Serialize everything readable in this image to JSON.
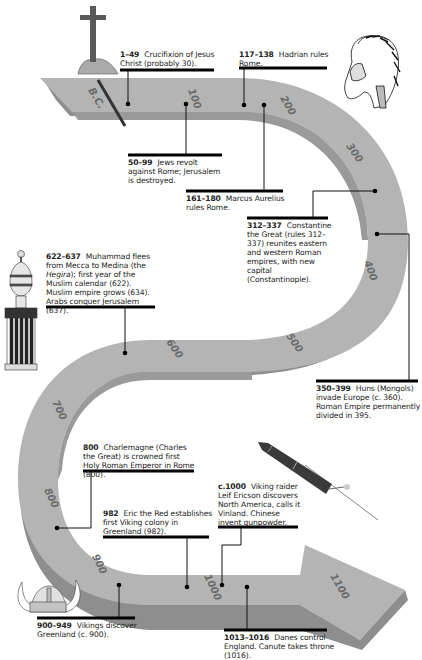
{
  "diagram": {
    "type": "timeline",
    "shape": "s-curve-arrow",
    "colors": {
      "ribbon_top": "#b4b4b4",
      "ribbon_side": "#8e8e8e",
      "line": "#111111",
      "text": "#222222"
    },
    "era_marker": "B.C.",
    "ticks": [
      "100",
      "200",
      "300",
      "400",
      "500",
      "600",
      "700",
      "800",
      "900",
      "1000",
      "1100"
    ],
    "events": [
      {
        "years": "1–49",
        "text": "Crucifixion of Jesus Christ (probably 30)."
      },
      {
        "years": "50–99",
        "text": "Jews revolt against Rome; Jerusalem is destroyed."
      },
      {
        "years": "117–138",
        "text": "Hadrian rules Rome."
      },
      {
        "years": "161–180",
        "text": "Marcus Aurelius rules Rome."
      },
      {
        "years": "312–337",
        "text": "Constantine the Great (rules 312–337) reunites eastern and western Roman empires, with new capital (Constantinople)."
      },
      {
        "years": "350–399",
        "text": "Huns (Mongols) invade Europe (c. 360). Roman Empire permanently divided in 395."
      },
      {
        "years": "622–637",
        "text_before": "Muhammad flees from Mecca to Medina (the ",
        "italic": "Hegira",
        "text_after": "); first year of the Muslim calendar (622). Muslim empire grows (634). Arabs conquer Jerusalem (637)."
      },
      {
        "years": "800",
        "text": "Charlemagne (Charles the Great) is crowned first Holy Roman Emperor in Rome (800)."
      },
      {
        "years": "982",
        "text": "Eric the Red establishes first Viking colony in Greenland (982)."
      },
      {
        "years": "c.1000",
        "text": "Viking raider Leif Ericson discovers North America, calls it Vinland. Chinese invent gunpowder."
      },
      {
        "years": "900–949",
        "text": "Vikings discover Greenland (c. 900)."
      },
      {
        "years": "1013–1016",
        "text": "Danes control England. Canute takes throne (1016)."
      }
    ],
    "illustrations": [
      "cross-icon",
      "roman-soldier-helmet-icon",
      "minaret-icon",
      "firework-rocket-icon",
      "viking-helmet-icon"
    ]
  }
}
